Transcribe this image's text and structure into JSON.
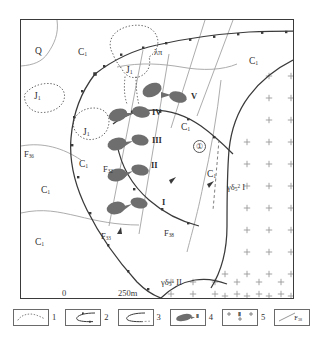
{
  "figure": {
    "kind": "geological-map"
  },
  "map": {
    "stratigraphic_labels": [
      {
        "id": "q",
        "text": "Q",
        "sub": "",
        "x": 14,
        "y": 27
      },
      {
        "id": "c1-a",
        "text": "C",
        "sub": "1",
        "x": 57,
        "y": 28
      },
      {
        "id": "j1-a",
        "text": "J",
        "sub": "1",
        "x": 13,
        "y": 72
      },
      {
        "id": "j1-b",
        "text": "J",
        "sub": "1",
        "x": 72,
        "y": 110
      },
      {
        "id": "j1-c",
        "text": "J",
        "sub": "1",
        "x": 107,
        "y": 51
      },
      {
        "id": "c1-b",
        "text": "C",
        "sub": "1",
        "x": 232,
        "y": 30
      },
      {
        "id": "c1-c",
        "text": "C",
        "sub": "1",
        "x": 161,
        "y": 100
      },
      {
        "id": "c1-d",
        "text": "C",
        "sub": "1",
        "x": 75,
        "y": 139
      },
      {
        "id": "c1-e",
        "text": "C",
        "sub": "1",
        "x": 190,
        "y": 152
      },
      {
        "id": "c1-f",
        "text": "C",
        "sub": "1",
        "x": 22,
        "y": 164
      },
      {
        "id": "c1-g",
        "text": "C",
        "sub": "1",
        "x": 17,
        "y": 216
      }
    ],
    "orebody_labels": [
      {
        "id": "ore-v",
        "text": "V",
        "x": 172,
        "y": 75
      },
      {
        "id": "ore-iv",
        "text": "IV",
        "x": 133,
        "y": 96
      },
      {
        "id": "ore-iii",
        "text": "III",
        "x": 133,
        "y": 126
      },
      {
        "id": "ore-ii",
        "text": "II",
        "x": 125,
        "y": 154
      },
      {
        "id": "ore-i",
        "text": "I",
        "x": 140,
        "y": 189
      }
    ],
    "fault_labels": [
      {
        "id": "f36",
        "text": "F",
        "sub": "36",
        "x": 5,
        "y": 134
      },
      {
        "id": "f32",
        "text": "F",
        "sub": "32",
        "x": 88,
        "y": 146
      },
      {
        "id": "f33",
        "text": "F",
        "sub": "33",
        "x": 82,
        "y": 216
      },
      {
        "id": "f38",
        "text": "F",
        "sub": "38",
        "x": 148,
        "y": 216
      }
    ],
    "dike_label": {
      "id": "dike-lambda-pi",
      "text": "λπ",
      "x": 138,
      "y": 32
    },
    "intrusion_labels": [
      {
        "id": "granodiorite-1",
        "base": "γδ",
        "sub": "5",
        "sup": "2",
        "numeral": "I",
        "x": 212,
        "y": 167
      },
      {
        "id": "granodiorite-2",
        "base": "γδ",
        "sub": "5",
        "sup": "1",
        "numeral": "II",
        "x": 161,
        "y": 277
      }
    ],
    "annotation_circle": {
      "id": "locality-1",
      "text": "①",
      "x": 177,
      "y": 125
    }
  },
  "scale_bar": {
    "left_label": "0",
    "right_label": "250m"
  },
  "legend": {
    "items": [
      {
        "num": "1",
        "symbol": "dotted-outline-area",
        "name": "quaternary-unit"
      },
      {
        "num": "2",
        "symbol": "geologic-boundary",
        "name": "unconformity-contact"
      },
      {
        "num": "3",
        "symbol": "geologic-boundary-alt",
        "name": "conformable-contact"
      },
      {
        "num": "4",
        "symbol": "orebody-lens",
        "name": "ore-body",
        "inner": "Ⅱ"
      },
      {
        "num": "5",
        "symbol": "granite-cross-hatch",
        "name": "granitic-intrusion",
        "inner": "Ⅱ"
      },
      {
        "num": "6",
        "symbol": "fault-line",
        "name": "fault",
        "inner": "F",
        "inner_sub": "38"
      }
    ]
  },
  "colors": {
    "orebody_fill": "#6e6e6e",
    "line": "#3a3a3a",
    "thin_line": "#8a8a8a",
    "cross_hatch": "#9a9a9a",
    "frame": "#3a3a3a",
    "text": "#2f2f2f"
  }
}
